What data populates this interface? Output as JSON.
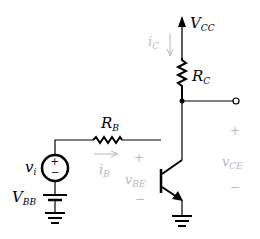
{
  "diagram": {
    "labels": {
      "vcc": "V",
      "vcc_sub": "CC",
      "rc": "R",
      "rc_sub": "C",
      "rb": "R",
      "rb_sub": "B",
      "ic": "i",
      "ic_sub": "C",
      "ib": "i",
      "ib_sub": "B",
      "vi": "v",
      "vi_sub": "i",
      "vbb": "V",
      "vbb_sub": "BB",
      "vbe": "v",
      "vbe_sub": "BE",
      "vce": "v",
      "vce_sub": "CE",
      "plus": "+",
      "minus": "−"
    },
    "colors": {
      "wire": "#000000",
      "faded_label": "#b8b8b8",
      "background": "#ffffff"
    }
  }
}
